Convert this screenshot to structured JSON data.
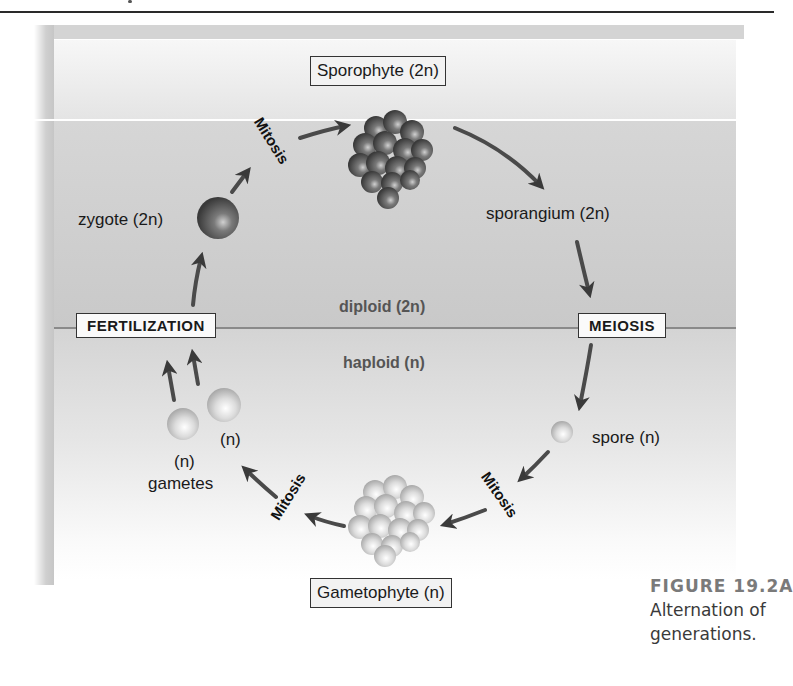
{
  "figure": {
    "caption": {
      "number": "FIGURE 19.2A",
      "text": "Alternation of generations."
    },
    "regions": {
      "diploid": "diploid (2n)",
      "haploid": "haploid (n)"
    },
    "stages": {
      "sporophyte": "Sporophyte (2n)",
      "sporangium": "sporangium (2n)",
      "spore": "spore (n)",
      "gametophyte": "Gametophyte (n)",
      "gamete_1": "(n)",
      "gamete_2": "(n)",
      "gametes": "gametes",
      "zygote": "zygote (2n)"
    },
    "processes": {
      "meiosis": "MEIOSIS",
      "fertilization": "FERTILIZATION",
      "mitosis_top": "Mitosis",
      "mitosis_right": "Mitosis",
      "mitosis_left": "Mitosis"
    },
    "colors": {
      "diploid_band": "#cfcfcf",
      "haploid_band": "#e2e2e2",
      "divider": "#8a8a8a",
      "caption_title": "#7a7a7a",
      "dark_cell": "#5a5a5a",
      "light_cell": "#d8d8d8"
    }
  }
}
